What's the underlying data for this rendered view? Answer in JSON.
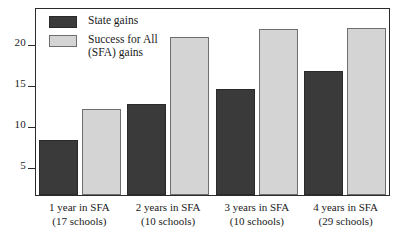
{
  "chart_data": {
    "type": "bar",
    "title": "",
    "subtitle": "",
    "xlabel": "",
    "ylabel": "",
    "grid": false,
    "legend_position": "top-left",
    "ylim": [
      1.5,
      24.5
    ],
    "yticks": [
      5,
      10,
      15,
      20
    ],
    "ytick_labels": [
      "5",
      "10",
      "15",
      "20"
    ],
    "categories": [
      "1 year in SFA\n(17 schools)",
      "2 years in SFA\n(10 schools)",
      "3 years in SFA\n(10 schools)",
      "4 years in SFA\n(29 schools)"
    ],
    "series": [
      {
        "name": "State gains",
        "color": "#3a3a3a",
        "values": [
          8.3,
          12.8,
          14.6,
          16.8
        ]
      },
      {
        "name": "Success for All\n(SFA) gains",
        "color": "#d4d4d4",
        "values": [
          12.1,
          21.0,
          22.0,
          22.2
        ]
      }
    ]
  },
  "legend": {
    "items": [
      {
        "label": "State gains",
        "swatch": "dark-swatch"
      },
      {
        "label": "Success for All\n(SFA) gains",
        "swatch": "light-swatch"
      }
    ]
  },
  "yaxis": {
    "tick_labels": [
      "20",
      "15",
      "10",
      "5"
    ]
  },
  "xaxis": {
    "labels": [
      "1 year in SFA\n(17 schools)",
      "2 years in SFA\n(10 schools)",
      "3 years in SFA\n(10 schools)",
      "4 years in SFA\n(29 schools)"
    ]
  }
}
